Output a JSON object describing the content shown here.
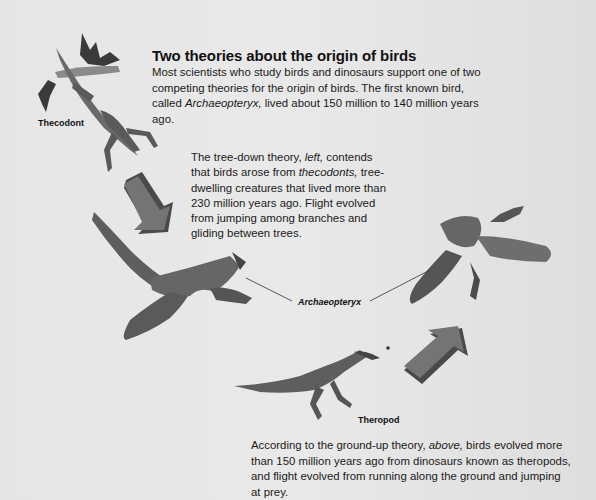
{
  "heading": {
    "title": "Two theories about the origin of birds"
  },
  "intro": {
    "part1": "Most scientists who study birds and dinosaurs support one of two competing theories for the origin of birds. The first known bird, called ",
    "italic": "Archaeopteryx,",
    "part2": " lived about 150 million to 140 million years ago."
  },
  "tree_down": {
    "part1": "The tree-down theory, ",
    "italic1": "left,",
    "part2": " contends that birds arose from ",
    "italic2": "thecodonts,",
    "part3": " tree-dwelling creatures that lived more than 230 million years ago. Flight evolved from jumping among branches and gliding between trees."
  },
  "ground_up": {
    "part1": "According to the ground-up theory, ",
    "italic": "above,",
    "part2": " birds evolved more than 150 million years ago from dinosaurs known as theropods, and flight evolved from running along the ground and jumping at prey."
  },
  "labels": {
    "thecodont": "Thecodont",
    "archaeopteryx": "Archaeopteryx",
    "theropod": "Theropod"
  },
  "illustrations": [
    {
      "name": "thecodont-illustration",
      "description": "lizard-like thecodont leaping from a leafy branch"
    },
    {
      "name": "archaeopteryx-left-illustration",
      "description": "Archaeopteryx gliding (tree-down)"
    },
    {
      "name": "archaeopteryx-right-illustration",
      "description": "Archaeopteryx flying (ground-up)"
    },
    {
      "name": "theropod-illustration",
      "description": "small bipedal theropod chasing an insect"
    }
  ],
  "colors": {
    "background": "#e6e6e6",
    "text": "#1a1a1a",
    "arrow_face": "#6e6e6e",
    "arrow_side": "#4a4a4a",
    "illustration": "#555555"
  }
}
